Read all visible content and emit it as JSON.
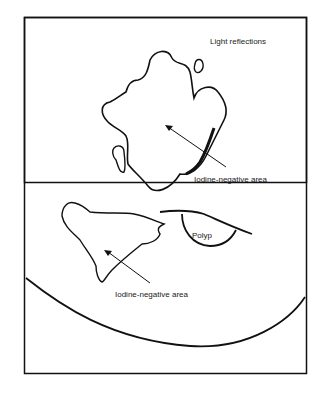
{
  "diagram": {
    "labels": {
      "light_reflections": "Light reflections",
      "iodine_negative_upper": "Iodine-negative area",
      "iodine_negative_lower": "Iodine-negative area",
      "polyp": "Polyp"
    },
    "colors": {
      "stroke": "#111111",
      "background": "#ffffff",
      "text": "#1a1a1a"
    }
  }
}
